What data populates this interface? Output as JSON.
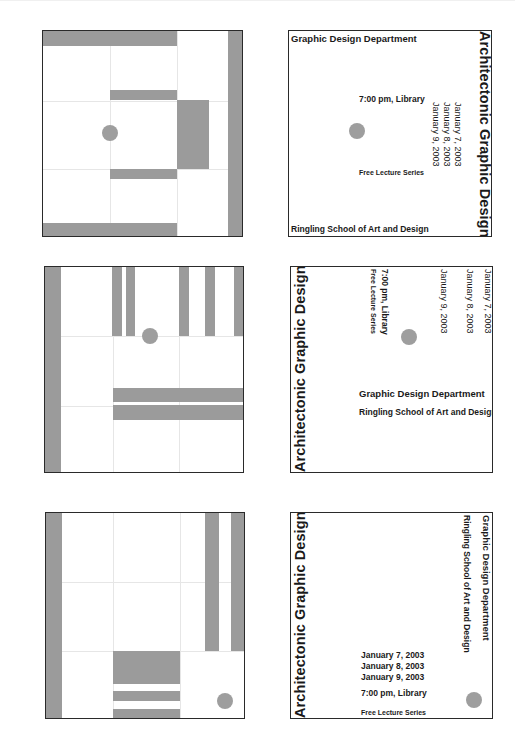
{
  "poster": {
    "title": "Architectonic Graphic Design",
    "department": "Graphic Design Department",
    "school": "Ringling School of Art and Design",
    "time_place": "7:00 pm, Library",
    "series": "Free Lecture Series",
    "dates": [
      "January 7, 2003",
      "January 8, 2003",
      "January 9, 2003"
    ]
  },
  "layout": {
    "rows": 3,
    "columns": [
      "abstract-composition",
      "typographic-composition"
    ]
  },
  "colors": {
    "block_gray": "#9b9b9b",
    "grid_line": "#e6e6e6",
    "frame": "#2a2a2a",
    "text": "#1a1a1a"
  }
}
